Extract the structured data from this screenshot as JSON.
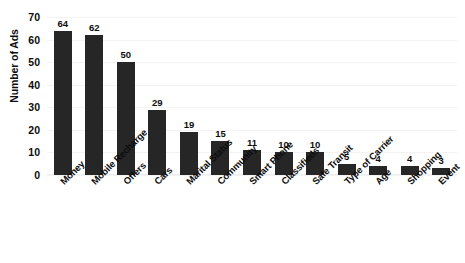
{
  "chart_data": {
    "type": "bar",
    "title": "",
    "xlabel": "",
    "ylabel": "Number of Ads",
    "ylim": [
      0,
      70
    ],
    "yticks": [
      0,
      10,
      20,
      30,
      40,
      50,
      60,
      70
    ],
    "grid": true,
    "legend": false,
    "bar_color": "#262626",
    "gridline_color": "#f3f3f3",
    "data_labels": true,
    "categories": [
      "Money",
      "Mobile Recharge",
      "Offers",
      "Cars",
      "Marital Status",
      "Community",
      "Smart Phone",
      "Classifieds",
      "Safe Transit",
      "Type of Carrier",
      "Age",
      "Shopping",
      "Event"
    ],
    "values": [
      64,
      62,
      50,
      29,
      19,
      15,
      11,
      10,
      10,
      5,
      4,
      4,
      3
    ]
  }
}
